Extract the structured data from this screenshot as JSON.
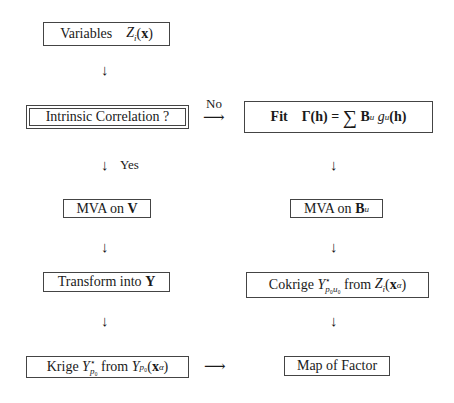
{
  "diagram": {
    "nodes": {
      "variables": {
        "text": "Variables",
        "math": "Z_i(x)"
      },
      "intrinsic": {
        "text": "Intrinsic Correlation ?"
      },
      "fit": {
        "text": "Fit",
        "math": "Γ(h) = ∑ B_u g_u(h)"
      },
      "mva_v": {
        "text": "MVA on",
        "math": "V"
      },
      "mva_bu": {
        "text": "MVA on",
        "math": "B_u"
      },
      "transform": {
        "text": "Transform into",
        "math": "Y"
      },
      "cokrige": {
        "text": "Cokrige",
        "math": "Y*_{p0u0} from Z_i(x_α)",
        "from": "from"
      },
      "krige": {
        "text": "Krige",
        "math": "Y*_{p0} from Y_{p0}(x_α)",
        "from": "from"
      },
      "map": {
        "text": "Map of Factor"
      }
    },
    "edge_labels": {
      "no": "No",
      "yes": "Yes"
    },
    "arrows": {
      "down": "↓",
      "right": "⟶"
    }
  }
}
